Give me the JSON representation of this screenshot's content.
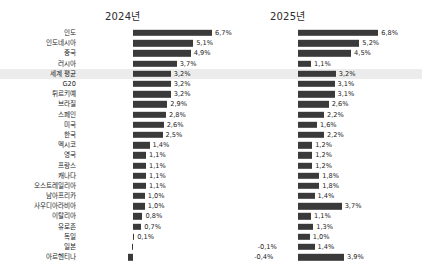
{
  "panels": {
    "left_title": "2024년",
    "right_title": "2025년"
  },
  "colors": {
    "bar": "#3a3a3a",
    "highlight_row": "#ececec",
    "text": "#1d1d1d",
    "background": "#ffffff"
  },
  "highlight_category": "세계 평균",
  "chart_data": {
    "type": "bar",
    "title": "",
    "xlabel": "",
    "ylabel": "",
    "orientation": "horizontal",
    "grid": false,
    "legend": "none",
    "xlim": [
      -0.5,
      7.0
    ],
    "categories": [
      "인도",
      "인도네시아",
      "중국",
      "러시아",
      "세계 평균",
      "G20",
      "튀르키예",
      "브라질",
      "스페인",
      "미국",
      "한국",
      "멕시코",
      "영국",
      "프랑스",
      "캐나다",
      "오스트레일리아",
      "남아프리카",
      "사우디아라비아",
      "이탈리아",
      "유로존",
      "독일",
      "일본",
      "아르헨티나"
    ],
    "series": [
      {
        "name": "2024년",
        "values": [
          6.7,
          5.1,
          4.9,
          3.7,
          3.2,
          3.2,
          3.2,
          2.9,
          2.8,
          2.6,
          2.5,
          1.4,
          1.1,
          1.1,
          1.1,
          1.1,
          1.0,
          1.0,
          0.8,
          0.7,
          0.1,
          -0.1,
          -0.4
        ],
        "labels": [
          "6,7%",
          "5,1%",
          "4,9%",
          "3,7%",
          "3,2%",
          "3,2%",
          "3,2%",
          "2,9%",
          "2,8%",
          "2,6%",
          "2,5%",
          "1,4%",
          "1,1%",
          "1,1%",
          "1,1%",
          "1,1%",
          "1,0%",
          "1,0%",
          "0,8%",
          "0,7%",
          "0,1%",
          "-0,1%",
          "-0,4%"
        ]
      },
      {
        "name": "2025년",
        "values": [
          6.8,
          5.2,
          4.5,
          1.1,
          3.2,
          3.1,
          3.1,
          2.6,
          2.2,
          1.6,
          2.2,
          1.2,
          1.2,
          1.2,
          1.8,
          1.8,
          1.4,
          3.7,
          1.1,
          1.3,
          1.0,
          1.4,
          3.9
        ],
        "labels": [
          "6,8%",
          "5,2%",
          "4,5%",
          "1,1%",
          "3,2%",
          "3,1%",
          "3,1%",
          "2,6%",
          "2,2%",
          "1,6%",
          "2,2%",
          "1,2%",
          "1,2%",
          "1,2%",
          "1,8%",
          "1,8%",
          "1,4%",
          "3,7%",
          "1,1%",
          "1,3%",
          "1,0%",
          "1,4%",
          "3,9%"
        ]
      }
    ]
  }
}
